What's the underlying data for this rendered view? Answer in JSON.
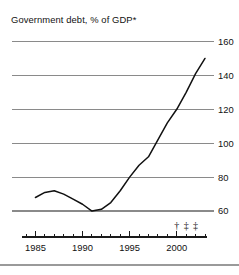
{
  "chart_data": {
    "type": "line",
    "title": "Government debt, % of GDP*",
    "xlabel": "",
    "ylabel": "",
    "xlim": [
      1984,
      2003
    ],
    "ylim": [
      50,
      165
    ],
    "yticks": [
      60,
      80,
      100,
      120,
      140,
      160
    ],
    "ytick_labels": [
      "60",
      "80",
      "100",
      "120",
      "140",
      "160"
    ],
    "xticks": [
      1985,
      1990,
      1995,
      2000
    ],
    "xtick_labels": [
      "1985",
      "1990",
      "1995",
      "2000"
    ],
    "xtick_minor_start": 1984,
    "xtick_minor_end": 2003,
    "grid": true,
    "grid_axis": "y",
    "legend": "none",
    "series": [
      {
        "name": "Government debt",
        "x": [
          1985,
          1986,
          1987,
          1988,
          1989,
          1990,
          1991,
          1992,
          1993,
          1994,
          1995,
          1996,
          1997,
          1998,
          1999,
          2000,
          2001,
          2002,
          2003
        ],
        "values": [
          68,
          71,
          72,
          70,
          67,
          64,
          60,
          61,
          65,
          72,
          80,
          87,
          92,
          102,
          112,
          120,
          130,
          141,
          150
        ]
      }
    ],
    "annotations": [
      {
        "symbol": "†",
        "x": 2000
      },
      {
        "symbol": "‡",
        "x": 2001
      },
      {
        "symbol": "‡",
        "x": 2002
      }
    ],
    "colors": {
      "line": "#111111",
      "grid": "#8a8a8a",
      "axis": "#1a1a1a",
      "background": "#ffffff"
    }
  }
}
